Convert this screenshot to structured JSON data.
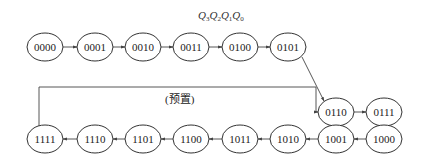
{
  "diagram": {
    "type": "state-transition",
    "header_label": {
      "parts": [
        {
          "base": "Q",
          "sub": "3"
        },
        {
          "base": "Q",
          "sub": "2"
        },
        {
          "base": "Q",
          "sub": "1"
        },
        {
          "base": "Q",
          "sub": "0"
        }
      ]
    },
    "preset_label": "(预置)",
    "nodes": [
      {
        "id": "s0000",
        "label": "0000"
      },
      {
        "id": "s0001",
        "label": "0001"
      },
      {
        "id": "s0010",
        "label": "0010"
      },
      {
        "id": "s0011",
        "label": "0011"
      },
      {
        "id": "s0100",
        "label": "0100"
      },
      {
        "id": "s0101",
        "label": "0101"
      },
      {
        "id": "s0110",
        "label": "0110"
      },
      {
        "id": "s0111",
        "label": "0111"
      },
      {
        "id": "s1000",
        "label": "1000"
      },
      {
        "id": "s1001",
        "label": "1001"
      },
      {
        "id": "s1010",
        "label": "1010"
      },
      {
        "id": "s1011",
        "label": "1011"
      },
      {
        "id": "s1100",
        "label": "1100"
      },
      {
        "id": "s1101",
        "label": "1101"
      },
      {
        "id": "s1110",
        "label": "1110"
      },
      {
        "id": "s1111",
        "label": "1111"
      }
    ],
    "edges": [
      {
        "from": "0000",
        "to": "0001"
      },
      {
        "from": "0001",
        "to": "0010"
      },
      {
        "from": "0010",
        "to": "0011"
      },
      {
        "from": "0011",
        "to": "0100"
      },
      {
        "from": "0100",
        "to": "0101"
      },
      {
        "from": "0101",
        "to": "0110"
      },
      {
        "from": "0110",
        "to": "0111"
      },
      {
        "from": "0111",
        "to": "1000"
      },
      {
        "from": "1000",
        "to": "1001"
      },
      {
        "from": "1001",
        "to": "1010"
      },
      {
        "from": "1010",
        "to": "1011"
      },
      {
        "from": "1011",
        "to": "1100"
      },
      {
        "from": "1100",
        "to": "1101"
      },
      {
        "from": "1101",
        "to": "1110"
      },
      {
        "from": "1110",
        "to": "1111"
      },
      {
        "from": "1111",
        "to": "0110",
        "label": "(预置)"
      }
    ]
  }
}
